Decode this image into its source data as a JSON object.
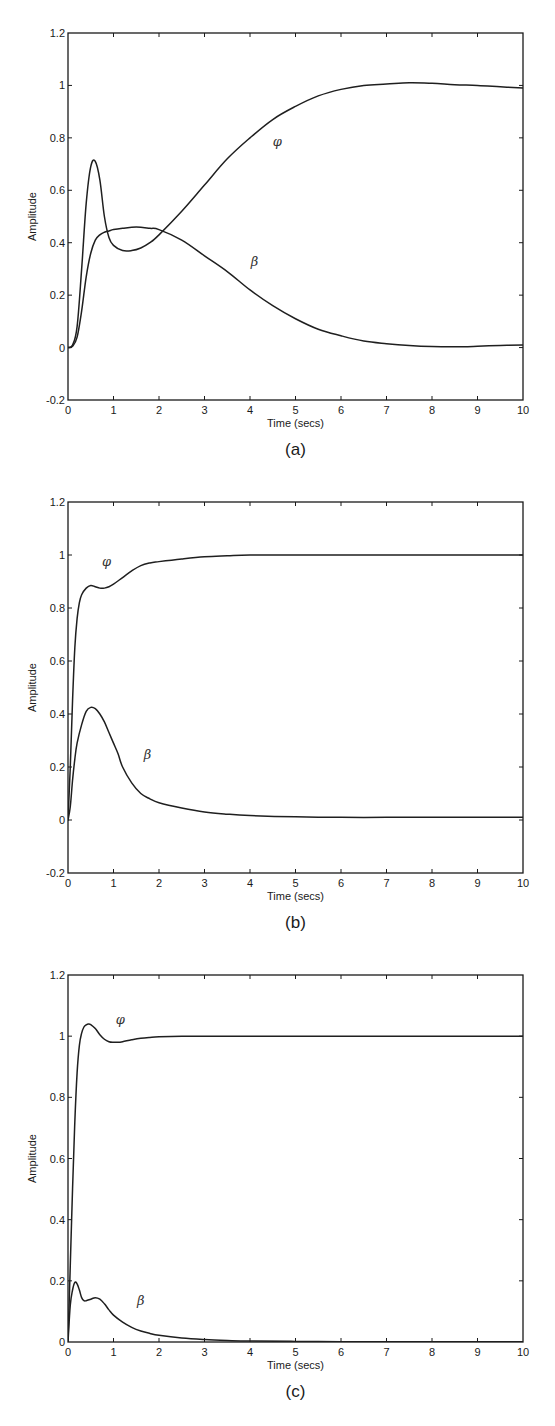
{
  "figures": [
    {
      "id": "a",
      "caption": "(a)",
      "xlabel": "Time (secs)",
      "ylabel": "Amplitude"
    },
    {
      "id": "b",
      "caption": "(b)",
      "xlabel": "Time (secs)",
      "ylabel": "Amplitude"
    },
    {
      "id": "c",
      "caption": "(c)",
      "xlabel": "Time (secs)",
      "ylabel": "Amplitude"
    }
  ],
  "chart_data": [
    {
      "type": "line",
      "title": "(a)",
      "xlabel": "Time (secs)",
      "ylabel": "Amplitude",
      "xlim": [
        0,
        10
      ],
      "ylim": [
        -0.2,
        1.2
      ],
      "xticks": [
        "0",
        "1",
        "2",
        "3",
        "4",
        "5",
        "6",
        "7",
        "8",
        "9",
        "10"
      ],
      "yticks": [
        "-0.2",
        "0",
        "0.2",
        "0.4",
        "0.6",
        "0.8",
        "1",
        "1.2"
      ],
      "grid": false,
      "annotations": [
        {
          "text": "φ",
          "x": 4.6,
          "y": 0.77
        },
        {
          "text": "β",
          "x": 4.1,
          "y": 0.31
        }
      ],
      "series": [
        {
          "name": "φ",
          "x": [
            0,
            0.1,
            0.2,
            0.3,
            0.4,
            0.5,
            0.6,
            0.7,
            0.8,
            0.9,
            1.0,
            1.2,
            1.4,
            1.6,
            1.8,
            2.0,
            2.5,
            3.0,
            3.5,
            4.0,
            4.5,
            5.0,
            5.5,
            6.0,
            6.5,
            7.0,
            7.5,
            8.0,
            8.5,
            9.0,
            9.5,
            10
          ],
          "values": [
            0,
            0.01,
            0.08,
            0.3,
            0.55,
            0.69,
            0.71,
            0.64,
            0.5,
            0.42,
            0.39,
            0.37,
            0.37,
            0.38,
            0.4,
            0.43,
            0.52,
            0.62,
            0.72,
            0.8,
            0.87,
            0.92,
            0.96,
            0.985,
            1.0,
            1.005,
            1.01,
            1.008,
            1.003,
            1.0,
            0.995,
            0.99
          ]
        },
        {
          "name": "β",
          "x": [
            0,
            0.1,
            0.2,
            0.3,
            0.4,
            0.5,
            0.6,
            0.7,
            0.8,
            0.9,
            1.0,
            1.2,
            1.5,
            1.8,
            2.0,
            2.5,
            3.0,
            3.5,
            4.0,
            4.5,
            5.0,
            5.5,
            6.0,
            6.5,
            7.0,
            7.5,
            8.0,
            8.5,
            9.0,
            9.5,
            10
          ],
          "values": [
            0,
            0.005,
            0.04,
            0.14,
            0.27,
            0.36,
            0.41,
            0.43,
            0.44,
            0.445,
            0.45,
            0.455,
            0.46,
            0.455,
            0.45,
            0.41,
            0.35,
            0.29,
            0.22,
            0.16,
            0.11,
            0.07,
            0.045,
            0.025,
            0.015,
            0.008,
            0.004,
            0.003,
            0.005,
            0.008,
            0.01
          ]
        }
      ]
    },
    {
      "type": "line",
      "title": "(b)",
      "xlabel": "Time (secs)",
      "ylabel": "Amplitude",
      "xlim": [
        0,
        10
      ],
      "ylim": [
        -0.2,
        1.2
      ],
      "xticks": [
        "0",
        "1",
        "2",
        "3",
        "4",
        "5",
        "6",
        "7",
        "8",
        "9",
        "10"
      ],
      "yticks": [
        "-0.2",
        "0",
        "0.2",
        "0.4",
        "0.6",
        "0.8",
        "1",
        "1.2"
      ],
      "grid": false,
      "annotations": [
        {
          "text": "φ",
          "x": 0.85,
          "y": 0.96
        },
        {
          "text": "β",
          "x": 1.75,
          "y": 0.23
        }
      ],
      "series": [
        {
          "name": "φ",
          "x": [
            0,
            0.05,
            0.1,
            0.15,
            0.2,
            0.25,
            0.3,
            0.4,
            0.5,
            0.6,
            0.7,
            0.8,
            0.9,
            1.0,
            1.2,
            1.4,
            1.6,
            1.8,
            2.0,
            2.5,
            3.0,
            3.5,
            4.0,
            5.0,
            6.0,
            7.0,
            8.0,
            9.0,
            10
          ],
          "values": [
            0,
            0.2,
            0.45,
            0.65,
            0.76,
            0.82,
            0.85,
            0.875,
            0.885,
            0.88,
            0.875,
            0.875,
            0.88,
            0.89,
            0.915,
            0.94,
            0.96,
            0.97,
            0.975,
            0.985,
            0.993,
            0.997,
            1.0,
            1.0,
            1.0,
            1.0,
            1.0,
            1.0,
            1.0
          ]
        },
        {
          "name": "β",
          "x": [
            0,
            0.05,
            0.1,
            0.15,
            0.2,
            0.3,
            0.4,
            0.5,
            0.6,
            0.7,
            0.8,
            0.9,
            1.0,
            1.1,
            1.2,
            1.4,
            1.6,
            1.8,
            2.0,
            2.5,
            3.0,
            3.5,
            4.0,
            5.0,
            6.0,
            7.0,
            8.0,
            9.0,
            10
          ],
          "values": [
            0,
            0.05,
            0.15,
            0.23,
            0.29,
            0.36,
            0.41,
            0.425,
            0.42,
            0.4,
            0.37,
            0.33,
            0.29,
            0.25,
            0.2,
            0.14,
            0.1,
            0.08,
            0.065,
            0.045,
            0.03,
            0.022,
            0.017,
            0.012,
            0.01,
            0.01,
            0.01,
            0.01,
            0.01
          ]
        }
      ]
    },
    {
      "type": "line",
      "title": "(c)",
      "xlabel": "Time (secs)",
      "ylabel": "Amplitude",
      "xlim": [
        0,
        10
      ],
      "ylim": [
        0,
        1.2
      ],
      "xticks": [
        "0",
        "1",
        "2",
        "3",
        "4",
        "5",
        "6",
        "7",
        "8",
        "9",
        "10"
      ],
      "yticks": [
        "0",
        "0.2",
        "0.4",
        "0.6",
        "0.8",
        "1",
        "1.2"
      ],
      "grid": false,
      "annotations": [
        {
          "text": "φ",
          "x": 1.15,
          "y": 1.04
        },
        {
          "text": "β",
          "x": 1.6,
          "y": 0.12
        }
      ],
      "series": [
        {
          "name": "φ",
          "x": [
            0,
            0.05,
            0.1,
            0.15,
            0.2,
            0.25,
            0.3,
            0.35,
            0.4,
            0.45,
            0.5,
            0.6,
            0.7,
            0.8,
            0.9,
            1.0,
            1.1,
            1.2,
            1.4,
            1.6,
            1.8,
            2.0,
            2.5,
            3.0,
            4.0,
            5.0,
            6.0,
            7.0,
            8.0,
            9.0,
            10
          ],
          "values": [
            0,
            0.25,
            0.5,
            0.72,
            0.88,
            0.97,
            1.01,
            1.03,
            1.037,
            1.04,
            1.038,
            1.025,
            1.005,
            0.99,
            0.982,
            0.98,
            0.98,
            0.982,
            0.988,
            0.993,
            0.996,
            0.998,
            1.0,
            1.0,
            1.0,
            1.0,
            1.0,
            1.0,
            1.0,
            1.0,
            1.0
          ]
        },
        {
          "name": "β",
          "x": [
            0,
            0.05,
            0.1,
            0.15,
            0.2,
            0.25,
            0.3,
            0.35,
            0.4,
            0.5,
            0.6,
            0.7,
            0.8,
            0.9,
            1.0,
            1.2,
            1.4,
            1.6,
            1.8,
            2.0,
            2.5,
            3.0,
            3.5,
            4.0,
            5.0,
            6.0,
            7.0,
            8.0,
            9.0,
            10
          ],
          "values": [
            0,
            0.12,
            0.17,
            0.195,
            0.19,
            0.17,
            0.145,
            0.135,
            0.135,
            0.14,
            0.145,
            0.14,
            0.125,
            0.105,
            0.088,
            0.065,
            0.048,
            0.036,
            0.028,
            0.022,
            0.013,
            0.008,
            0.005,
            0.003,
            0.002,
            0.001,
            0.001,
            0.001,
            0.001,
            0.001
          ]
        }
      ]
    }
  ]
}
